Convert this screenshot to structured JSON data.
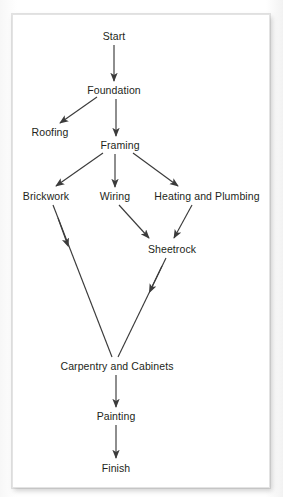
{
  "diagram": {
    "type": "directed-graph",
    "style": {
      "line_color": "#3b3b3b",
      "text_color": "#231f20",
      "card_background": "#ffffff",
      "page_background": "#fdfdfd"
    },
    "nodes": [
      {
        "id": "start",
        "label": "Start",
        "cx": 114,
        "cy": 36
      },
      {
        "id": "foundation",
        "label": "Foundation",
        "cx": 114,
        "cy": 90
      },
      {
        "id": "roofing",
        "label": "Roofing",
        "cx": 50,
        "cy": 132
      },
      {
        "id": "framing",
        "label": "Framing",
        "cx": 120,
        "cy": 145
      },
      {
        "id": "brickwork",
        "label": "Brickwork",
        "cx": 46,
        "cy": 196
      },
      {
        "id": "wiring",
        "label": "Wiring",
        "cx": 115,
        "cy": 196
      },
      {
        "id": "heating",
        "label": "Heating and Plumbing",
        "cx": 207,
        "cy": 196
      },
      {
        "id": "sheetrock",
        "label": "Sheetrock",
        "cx": 172,
        "cy": 249
      },
      {
        "id": "carpentry",
        "label": "Carpentry and Cabinets",
        "cx": 117,
        "cy": 366
      },
      {
        "id": "painting",
        "label": "Painting",
        "cx": 116,
        "cy": 416
      },
      {
        "id": "finish",
        "label": "Finish",
        "cx": 116,
        "cy": 468
      }
    ],
    "edges": [
      {
        "from": "start",
        "to": "foundation",
        "arrowhead": "end"
      },
      {
        "from": "foundation",
        "to": "roofing",
        "arrowhead": "end"
      },
      {
        "from": "foundation",
        "to": "framing",
        "arrowhead": "end"
      },
      {
        "from": "framing",
        "to": "brickwork",
        "arrowhead": "end"
      },
      {
        "from": "framing",
        "to": "wiring",
        "arrowhead": "end"
      },
      {
        "from": "framing",
        "to": "heating",
        "arrowhead": "end"
      },
      {
        "from": "brickwork",
        "to": "carpentry",
        "arrowhead": "midline"
      },
      {
        "from": "wiring",
        "to": "sheetrock",
        "arrowhead": "end"
      },
      {
        "from": "heating",
        "to": "sheetrock",
        "arrowhead": "end"
      },
      {
        "from": "sheetrock",
        "to": "carpentry",
        "arrowhead": "midline"
      },
      {
        "from": "carpentry",
        "to": "painting",
        "arrowhead": "end"
      },
      {
        "from": "painting",
        "to": "finish",
        "arrowhead": "end"
      }
    ]
  }
}
